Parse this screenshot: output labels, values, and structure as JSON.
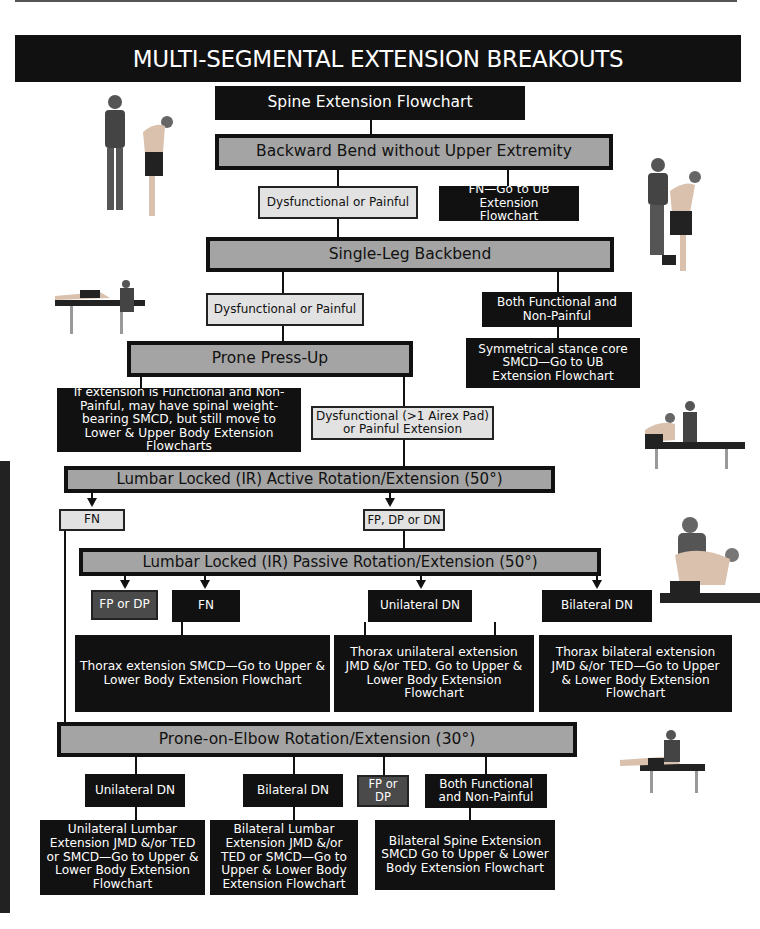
{
  "header": {
    "title": "MULTI-SEGMENTAL EXTENSION BREAKOUTS"
  },
  "flowchart": {
    "start": "Spine Extension Flowchart",
    "backward_bend": {
      "title": "Backward Bend without Upper Extremity",
      "dp": "Dysfunctional or Painful",
      "fn": "FN—Go to UB Extension Flowchart"
    },
    "single_leg": {
      "title": "Single-Leg Backbend",
      "dp": "Dysfunctional or Painful",
      "fn": "Both Functional and Non-Painful",
      "fn_result": "Symmetrical stance core SMCD—Go to UB Extension Flowchart"
    },
    "prone_press": {
      "title": "Prone Press-Up",
      "fn_note": "If extension is Functional and Non-Painful, may have spinal weight-bearing SMCD, but still move to Lower & Upper Body Extension Flowcharts",
      "dp": "Dysfunctional (>1 Airex Pad) or Painful Extension"
    },
    "active_rot": {
      "title": "Lumbar Locked (IR) Active Rotation/Extension (50°)",
      "fn": "FN",
      "other": "FP, DP or DN"
    },
    "passive_rot": {
      "title": "Lumbar Locked (IR) Passive Rotation/Extension (50°)",
      "fpdp": "FP or DP",
      "fn": "FN",
      "uni": "Unilateral DN",
      "bi": "Bilateral DN",
      "fn_result": "Thorax extension SMCD—Go to Upper & Lower Body Extension Flowchart",
      "uni_result": "Thorax unilateral extension JMD &/or TED. Go to Upper & Lower Body Extension Flowchart",
      "bi_result": "Thorax bilateral extension JMD &/or TED—Go to Upper & Lower Body Extension Flowchart"
    },
    "prone_elbow": {
      "title": "Prone-on-Elbow Rotation/Extension (30°)",
      "uni": "Unilateral DN",
      "bi": "Bilateral DN",
      "fpdp": "FP or DP",
      "fn": "Both Functional and Non-Painful",
      "uni_result": "Unilateral Lumbar Extension JMD &/or TED or SMCD—Go to Upper & Lower Body Extension Flowchart",
      "bi_result": "Bilateral Lumbar Extension JMD &/or TED or SMCD—Go to Upper & Lower Body Extension Flowchart",
      "fn_result": "Bilateral Spine Extension SMCD Go to Upper & Lower Body Extension Flowchart"
    }
  },
  "colors": {
    "black": "#111111",
    "gray": "#a4a4a4",
    "light": "#e2e2e2",
    "dark": "#4a4a4a"
  },
  "photos": [
    "photo-backward-bend",
    "photo-single-leg-backbend",
    "photo-prone-press-up",
    "photo-active-rotation",
    "photo-passive-rotation",
    "photo-prone-on-elbow"
  ]
}
